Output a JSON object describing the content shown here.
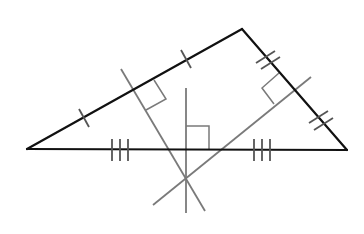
{
  "diagram": {
    "colors": {
      "sides": "#111111",
      "bisectors": "#7a7a7a",
      "ticks": "#555555",
      "background": "#ffffff"
    },
    "vertices": {
      "A": [
        27,
        149
      ],
      "B": [
        242,
        29
      ],
      "C": [
        347,
        150
      ]
    },
    "circumcenter": [
      186,
      180
    ],
    "bisectors": [
      {
        "side": "AB",
        "from": [
          121,
          69
        ],
        "to": [
          205,
          211
        ],
        "tick_marks": 1
      },
      {
        "side": "BC",
        "from": [
          153,
          205
        ],
        "to": [
          311,
          77
        ],
        "tick_marks": 2
      },
      {
        "side": "AC",
        "from": [
          186,
          88
        ],
        "to": [
          186,
          213
        ],
        "tick_marks": 3
      }
    ],
    "right_angle_markers": 3
  }
}
